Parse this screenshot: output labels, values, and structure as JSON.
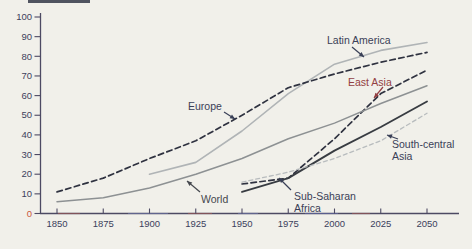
{
  "page": {
    "background": "#f1f0ea"
  },
  "chart_data": {
    "type": "line",
    "title": "",
    "xlabel": "",
    "ylabel": "",
    "x_range": [
      1850,
      2050
    ],
    "y_range": [
      0,
      100
    ],
    "x_ticks": [
      1850,
      1875,
      1900,
      1925,
      1950,
      1975,
      2000,
      2025,
      2050
    ],
    "y_ticks": [
      0,
      10,
      20,
      30,
      40,
      50,
      60,
      70,
      80,
      90,
      100
    ],
    "grid": false,
    "legend_position": "inline-annotations",
    "colors": {
      "axis": "#4d4a63",
      "tick_label": "#3c415c",
      "zero_tick_label": "#c9573b",
      "dark_dashed_line": "#2f3240",
      "light_solid_line": "#b0b4b6",
      "mid_solid_line": "#8d9193",
      "black_solid_line": "#383c42",
      "light_dashed_line": "#b8bcbe",
      "annotation_navy": "#3a4057",
      "annotation_red": "#934043",
      "annotation_gray": "#45484e"
    },
    "series": [
      {
        "name": "Latin America",
        "style": "solid",
        "color": "#b0b4b6",
        "width": 1.6,
        "points": [
          [
            1900,
            20
          ],
          [
            1925,
            26
          ],
          [
            1950,
            42
          ],
          [
            1975,
            61
          ],
          [
            2000,
            76
          ],
          [
            2025,
            83
          ],
          [
            2050,
            87
          ]
        ]
      },
      {
        "name": "Europe",
        "style": "dashed",
        "color": "#2f3240",
        "width": 1.7,
        "points": [
          [
            1850,
            11
          ],
          [
            1875,
            18
          ],
          [
            1900,
            28
          ],
          [
            1925,
            37
          ],
          [
            1950,
            50
          ],
          [
            1975,
            64
          ],
          [
            2000,
            71
          ],
          [
            2025,
            77
          ],
          [
            2050,
            82
          ]
        ]
      },
      {
        "name": "East Asia",
        "style": "dashed",
        "color": "#2f3240",
        "width": 1.7,
        "points": [
          [
            1950,
            15
          ],
          [
            1975,
            18
          ],
          [
            2000,
            38
          ],
          [
            2025,
            61
          ],
          [
            2050,
            73
          ]
        ]
      },
      {
        "name": "World",
        "style": "solid",
        "color": "#8d9193",
        "width": 1.5,
        "points": [
          [
            1850,
            6
          ],
          [
            1875,
            8
          ],
          [
            1900,
            13
          ],
          [
            1925,
            20
          ],
          [
            1950,
            28
          ],
          [
            1975,
            38
          ],
          [
            2000,
            46
          ],
          [
            2025,
            56
          ],
          [
            2050,
            65
          ]
        ]
      },
      {
        "name": "Sub-Saharan Africa",
        "style": "solid",
        "color": "#383c42",
        "width": 1.9,
        "points": [
          [
            1950,
            11
          ],
          [
            1975,
            18
          ],
          [
            2000,
            32
          ],
          [
            2025,
            44
          ],
          [
            2050,
            57
          ]
        ]
      },
      {
        "name": "South-central Asia",
        "style": "dashed",
        "color": "#b8bcbe",
        "width": 1.3,
        "points": [
          [
            1950,
            16
          ],
          [
            1975,
            21
          ],
          [
            2000,
            28
          ],
          [
            2025,
            37
          ],
          [
            2050,
            51
          ]
        ]
      }
    ],
    "annotations": [
      {
        "lines": [
          "Latin America"
        ],
        "color": "#3a4057",
        "x": 327,
        "y": 44,
        "arrow": [
          352,
          47,
          364,
          57
        ]
      },
      {
        "lines": [
          "Europe"
        ],
        "color": "#3a4057",
        "x": 188,
        "y": 110,
        "arrow": [
          224,
          112,
          235,
          119
        ]
      },
      {
        "lines": [
          "East Asia"
        ],
        "color": "#934043",
        "x": 348,
        "y": 86,
        "arrow": [
          383,
          87,
          374,
          98
        ]
      },
      {
        "lines": [
          "World"
        ],
        "color": "#45484e",
        "x": 201,
        "y": 203,
        "arrow": [
          200,
          192,
          187,
          181
        ]
      },
      {
        "lines": [
          "Sub-Saharan",
          "Africa"
        ],
        "color": "#3a4057",
        "x": 294,
        "y": 200,
        "arrow": [
          291,
          190,
          279,
          178
        ]
      },
      {
        "lines": [
          "South-central",
          "Asia"
        ],
        "color": "#3a4057",
        "x": 392,
        "y": 148,
        "arrow": [
          398,
          139,
          387,
          135
        ]
      }
    ]
  }
}
